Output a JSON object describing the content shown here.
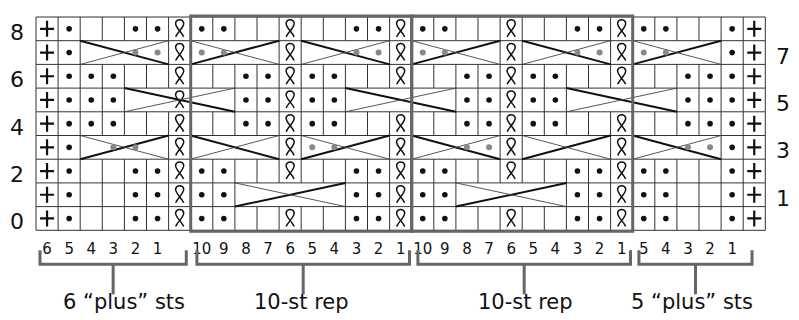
{
  "chart_data": {
    "type": "knitting-chart",
    "rows": 9,
    "columns": 33,
    "row_labels_left": [
      "8",
      "6",
      "4",
      "2",
      "0"
    ],
    "row_labels_right": [
      "7",
      "5",
      "3",
      "1"
    ],
    "bottom_numbers": {
      "left_plus": [
        "6",
        "5",
        "4",
        "3",
        "2",
        "1"
      ],
      "rep1": [
        "10",
        "9",
        "8",
        "7",
        "6",
        "5",
        "4",
        "3",
        "2",
        "1"
      ],
      "rep2": [
        "10",
        "9",
        "8",
        "7",
        "6",
        "5",
        "4",
        "3",
        "2",
        "1"
      ],
      "right_plus": [
        "5",
        "4",
        "3",
        "2",
        "1"
      ]
    },
    "sections": [
      {
        "name": "6 plus sts",
        "label": "6 “plus” sts",
        "col_start": 0,
        "col_end": 6
      },
      {
        "name": "10-st rep",
        "label": "10-st rep",
        "col_start": 7,
        "col_end": 16
      },
      {
        "name": "10-st rep",
        "label": "10-st rep",
        "col_start": 17,
        "col_end": 26
      },
      {
        "name": "5 plus sts",
        "label": "5 “plus” sts",
        "col_start": 27,
        "col_end": 32
      }
    ],
    "legend_symbols": {
      "+": "edge stitch",
      "dot": "purl",
      "twist": "knit through back loop",
      "empty": "knit"
    },
    "grid_rows": [
      [
        "+",
        "dot",
        "",
        "",
        "dot",
        "dot",
        "twist",
        "dot",
        "dot",
        "",
        "",
        "twist",
        "",
        "",
        "dot",
        "dot",
        "twist",
        "dot",
        "dot",
        "",
        "",
        "twist",
        "",
        "",
        "dot",
        "dot",
        "twist",
        "dot",
        "dot",
        "",
        "",
        "dot",
        "+"
      ],
      [
        "+",
        "dot",
        "",
        "",
        "",
        "",
        "twist",
        "",
        "",
        "",
        "",
        "twist",
        "",
        "",
        "",
        "",
        "twist",
        "",
        "",
        "",
        "",
        "twist",
        "",
        "",
        "",
        "",
        "twist",
        "",
        "",
        "",
        "",
        "dot",
        "+"
      ],
      [
        "+",
        "dot",
        "dot",
        "dot",
        "",
        "",
        "twist",
        "",
        "",
        "dot",
        "dot",
        "twist",
        "dot",
        "dot",
        "",
        "",
        "twist",
        "",
        "",
        "dot",
        "dot",
        "twist",
        "dot",
        "dot",
        "",
        "",
        "twist",
        "",
        "",
        "dot",
        "dot",
        "dot",
        "+"
      ],
      [
        "+",
        "dot",
        "dot",
        "dot",
        "",
        "",
        "twist",
        "",
        "",
        "dot",
        "dot",
        "twist",
        "dot",
        "dot",
        "",
        "",
        "",
        "",
        "",
        "dot",
        "dot",
        "twist",
        "dot",
        "dot",
        "",
        "",
        "",
        "",
        "",
        "dot",
        "dot",
        "dot",
        "+"
      ],
      [
        "+",
        "dot",
        "dot",
        "dot",
        "",
        "",
        "twist",
        "",
        "",
        "dot",
        "dot",
        "twist",
        "dot",
        "dot",
        "",
        "",
        "twist",
        "",
        "",
        "dot",
        "dot",
        "twist",
        "dot",
        "dot",
        "",
        "",
        "twist",
        "",
        "",
        "dot",
        "dot",
        "dot",
        "+"
      ],
      [
        "+",
        "dot",
        "",
        "",
        "",
        "",
        "twist",
        "",
        "",
        "",
        "",
        "twist",
        "",
        "",
        "",
        "",
        "twist",
        "",
        "",
        "",
        "",
        "twist",
        "",
        "",
        "",
        "",
        "twist",
        "",
        "",
        "",
        "",
        "dot",
        "+"
      ],
      [
        "+",
        "dot",
        "",
        "",
        "dot",
        "dot",
        "twist",
        "dot",
        "dot",
        "",
        "",
        "twist",
        "",
        "",
        "dot",
        "dot",
        "twist",
        "dot",
        "dot",
        "",
        "",
        "twist",
        "",
        "",
        "dot",
        "dot",
        "twist",
        "dot",
        "dot",
        "",
        "",
        "dot",
        "+"
      ],
      [
        "+",
        "dot",
        "",
        "",
        "dot",
        "dot",
        "twist",
        "dot",
        "dot",
        "",
        "",
        "",
        "",
        "",
        "dot",
        "dot",
        "twist",
        "dot",
        "dot",
        "",
        "",
        "",
        "",
        "",
        "dot",
        "dot",
        "twist",
        "dot",
        "dot",
        "",
        "",
        "dot",
        "+"
      ],
      [
        "+",
        "dot",
        "",
        "",
        "dot",
        "dot",
        "twist",
        "dot",
        "dot",
        "",
        "",
        "twist",
        "",
        "",
        "dot",
        "dot",
        "twist",
        "dot",
        "dot",
        "",
        "",
        "twist",
        "",
        "",
        "dot",
        "dot",
        "twist",
        "dot",
        "dot",
        "",
        "",
        "dot",
        "+"
      ]
    ],
    "cables": [
      {
        "row": 1,
        "col_start": 2,
        "col_end": 5,
        "dir": "right",
        "dots": [
          4,
          5
        ]
      },
      {
        "row": 1,
        "col_start": 7,
        "col_end": 10,
        "dir": "left",
        "dots": [
          7,
          8
        ]
      },
      {
        "row": 1,
        "col_start": 12,
        "col_end": 15,
        "dir": "right",
        "dots": [
          14,
          15
        ]
      },
      {
        "row": 1,
        "col_start": 17,
        "col_end": 20,
        "dir": "left",
        "dots": [
          17,
          18
        ]
      },
      {
        "row": 1,
        "col_start": 22,
        "col_end": 25,
        "dir": "right",
        "dots": [
          24,
          25
        ]
      },
      {
        "row": 1,
        "col_start": 27,
        "col_end": 30,
        "dir": "left",
        "dots": [
          27,
          28
        ]
      },
      {
        "row": 3,
        "col_start": 4,
        "col_end": 8,
        "dir": "right",
        "dots": []
      },
      {
        "row": 3,
        "col_start": 14,
        "col_end": 18,
        "dir": "right",
        "dots": []
      },
      {
        "row": 3,
        "col_start": 24,
        "col_end": 28,
        "dir": "right",
        "dots": []
      },
      {
        "row": 5,
        "col_start": 2,
        "col_end": 5,
        "dir": "left",
        "dots": [
          3,
          4
        ]
      },
      {
        "row": 5,
        "col_start": 7,
        "col_end": 10,
        "dir": "right",
        "dots": []
      },
      {
        "row": 5,
        "col_start": 12,
        "col_end": 15,
        "dir": "left",
        "dots": [
          12,
          13
        ]
      },
      {
        "row": 5,
        "col_start": 17,
        "col_end": 20,
        "dir": "right",
        "dots": [
          19,
          20
        ]
      },
      {
        "row": 5,
        "col_start": 22,
        "col_end": 25,
        "dir": "left",
        "dots": []
      },
      {
        "row": 5,
        "col_start": 27,
        "col_end": 30,
        "dir": "right",
        "dots": [
          29,
          30
        ]
      },
      {
        "row": 7,
        "col_start": 9,
        "col_end": 13,
        "dir": "left",
        "dots": []
      },
      {
        "row": 7,
        "col_start": 19,
        "col_end": 23,
        "dir": "left",
        "dots": []
      }
    ],
    "colors": {
      "grid": "#333333",
      "section_border": "#666666",
      "dot_gray": "#888888",
      "bracket": "#666666"
    }
  }
}
